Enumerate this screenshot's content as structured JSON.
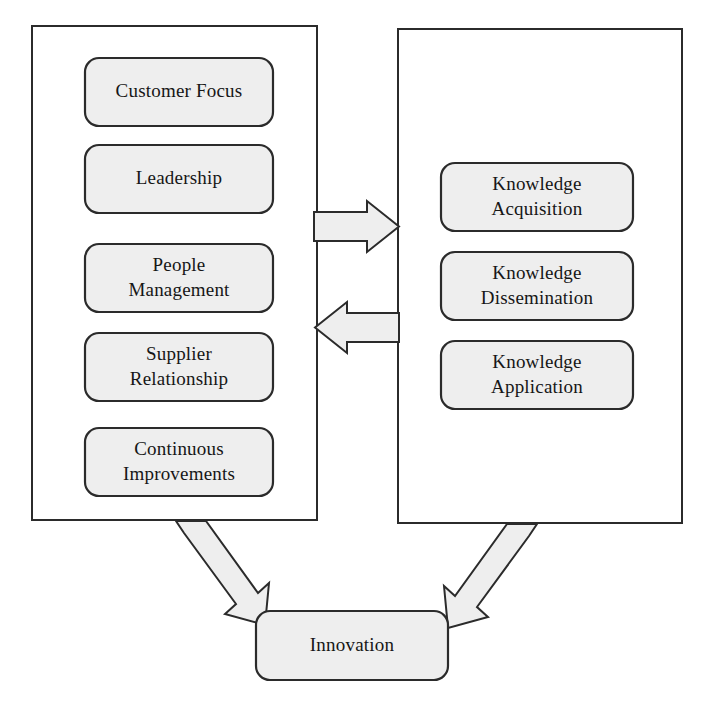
{
  "diagram": {
    "colors": {
      "node_fill": "#eeeeee",
      "node_stroke": "#2b2b2b",
      "container_stroke": "#2b2b2b",
      "arrow_fill": "#eeeeee",
      "arrow_stroke": "#2b2b2b",
      "background": "#ffffff",
      "text": "#161616"
    },
    "left_group": {
      "name": "quality-management-group",
      "nodes": [
        {
          "id": "customer-focus",
          "lines": [
            "Customer Focus"
          ]
        },
        {
          "id": "leadership",
          "lines": [
            "Leadership"
          ]
        },
        {
          "id": "people-management",
          "lines": [
            "People",
            "Management"
          ]
        },
        {
          "id": "supplier-relationship",
          "lines": [
            "Supplier",
            "Relationship"
          ]
        },
        {
          "id": "continuous-improvements",
          "lines": [
            "Continuous",
            "Improvements"
          ]
        }
      ]
    },
    "right_group": {
      "name": "knowledge-management-group",
      "nodes": [
        {
          "id": "knowledge-acquisition",
          "lines": [
            "Knowledge",
            "Acquisition"
          ]
        },
        {
          "id": "knowledge-dissemination",
          "lines": [
            "Knowledge",
            "Dissemination"
          ]
        },
        {
          "id": "knowledge-application",
          "lines": [
            "Knowledge",
            "Application"
          ]
        }
      ]
    },
    "outcome": {
      "id": "innovation",
      "lines": [
        "Innovation"
      ]
    },
    "connectors": [
      {
        "id": "left-to-right-arrow",
        "direction": "right",
        "from": "quality-management-group",
        "to": "knowledge-management-group"
      },
      {
        "id": "right-to-left-arrow",
        "direction": "left",
        "from": "knowledge-management-group",
        "to": "quality-management-group"
      },
      {
        "id": "left-to-innovation-arrow",
        "direction": "down-right",
        "from": "quality-management-group",
        "to": "innovation"
      },
      {
        "id": "right-to-innovation-arrow",
        "direction": "down-left",
        "from": "knowledge-management-group",
        "to": "innovation"
      }
    ]
  }
}
